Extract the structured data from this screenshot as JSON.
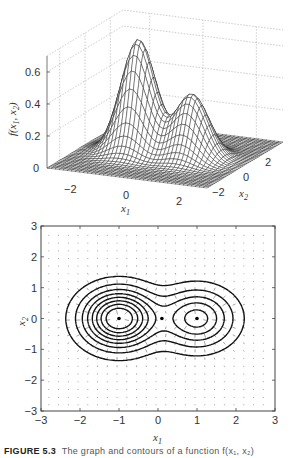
{
  "chart_data": [
    {
      "type": "surface",
      "title": "",
      "xlabel": "x1",
      "ylabel": "x2",
      "zlabel": "f(x1, x2)",
      "x_ticks": [
        -2,
        0,
        2
      ],
      "y_ticks": [
        -2,
        0,
        2
      ],
      "z_ticks": [
        0,
        0.2,
        0.4,
        0.6
      ],
      "xlim": [
        -3,
        3
      ],
      "ylim": [
        -3,
        3
      ],
      "zlim": [
        0,
        0.7
      ],
      "grid": true,
      "peaks": [
        {
          "x1": -1,
          "x2": 0,
          "height": 0.7
        },
        {
          "x1": 1,
          "x2": 0,
          "height": 0.4
        }
      ]
    },
    {
      "type": "contour+quiver",
      "title": "",
      "xlabel": "x1",
      "ylabel": "x2",
      "x_ticks": [
        -3,
        -2,
        -1,
        0,
        1,
        2,
        3
      ],
      "y_ticks": [
        -3,
        -2,
        -1,
        0,
        1,
        2,
        3
      ],
      "xlim": [
        -3,
        3
      ],
      "ylim": [
        -3,
        3
      ],
      "grid": false,
      "critical_points": [
        {
          "x1": -1,
          "x2": 0,
          "kind": "maximum"
        },
        {
          "x1": 0.1,
          "x2": 0,
          "kind": "saddle"
        },
        {
          "x1": 1,
          "x2": 0,
          "kind": "maximum"
        }
      ]
    }
  ],
  "labels": {
    "z_axis": "f(x",
    "x1": "x",
    "x2": "x",
    "sub1": "1",
    "sub2": "2",
    "comma": ", x",
    "close": ")"
  },
  "caption": {
    "figure": "FIGURE 5.3",
    "text": "The graph and contours of a function f(x₁, x₂)"
  },
  "colors": {
    "mesh": "#222222",
    "grid": "#aaaaaa",
    "axis": "#555555"
  }
}
